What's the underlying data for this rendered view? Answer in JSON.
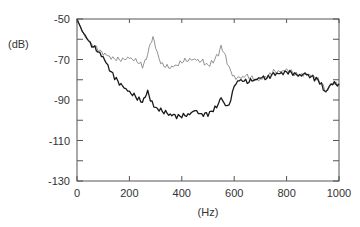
{
  "chart_data": {
    "type": "line",
    "title": "",
    "xlabel": "(Hz)",
    "ylabel": "(dB)",
    "xlim": [
      0,
      1000
    ],
    "ylim": [
      -130,
      -50
    ],
    "xticks": [
      0,
      200,
      400,
      600,
      800,
      1000
    ],
    "yticks": [
      -50,
      -70,
      -90,
      -110,
      -130
    ],
    "grid": false,
    "legend": null,
    "series": [
      {
        "name": "upper (thin gray)",
        "color": "#777777",
        "width": 0.8,
        "x": [
          0,
          20,
          50,
          80,
          100,
          130,
          150,
          180,
          200,
          230,
          250,
          265,
          280,
          290,
          300,
          320,
          350,
          380,
          400,
          430,
          450,
          480,
          500,
          520,
          540,
          550,
          560,
          580,
          600,
          620,
          650,
          680,
          700,
          730,
          750,
          780,
          800,
          830,
          850,
          870,
          900,
          920,
          940,
          950,
          970,
          1000
        ],
        "y": [
          -50,
          -56,
          -62,
          -65,
          -67,
          -69,
          -70,
          -70,
          -69,
          -71,
          -73,
          -69,
          -62,
          -59,
          -64,
          -72,
          -74,
          -73,
          -71,
          -70,
          -70,
          -71,
          -73,
          -71,
          -67,
          -63,
          -66,
          -74,
          -79,
          -79,
          -78,
          -80,
          -80,
          -78,
          -76,
          -76,
          -75,
          -77,
          -78,
          -77,
          -78,
          -80,
          -83,
          -86,
          -82,
          -82
        ]
      },
      {
        "name": "lower (thick dark)",
        "color": "#1a1a1a",
        "width": 1.3,
        "x": [
          0,
          20,
          50,
          80,
          100,
          130,
          150,
          180,
          200,
          230,
          250,
          260,
          270,
          280,
          300,
          320,
          350,
          380,
          400,
          430,
          450,
          470,
          500,
          520,
          540,
          550,
          560,
          580,
          600,
          620,
          650,
          680,
          700,
          730,
          750,
          780,
          800,
          830,
          850,
          870,
          900,
          920,
          940,
          950,
          970,
          1000
        ],
        "y": [
          -50,
          -56,
          -62,
          -66,
          -69,
          -76,
          -80,
          -84,
          -86,
          -89,
          -91,
          -88,
          -86,
          -90,
          -94,
          -95,
          -97,
          -98,
          -98,
          -97,
          -95,
          -97,
          -97,
          -95,
          -92,
          -88,
          -92,
          -93,
          -83,
          -80,
          -81,
          -80,
          -79,
          -79,
          -77,
          -77,
          -76,
          -77,
          -78,
          -77,
          -79,
          -80,
          -84,
          -86,
          -82,
          -82
        ]
      }
    ]
  },
  "axes": {
    "xlabel": "(Hz)",
    "ylabel": "(dB)",
    "xtick_labels": [
      "0",
      "200",
      "400",
      "600",
      "800",
      "1000"
    ],
    "ytick_labels": [
      "-50",
      "-70",
      "-90",
      "-110",
      "-130"
    ]
  }
}
